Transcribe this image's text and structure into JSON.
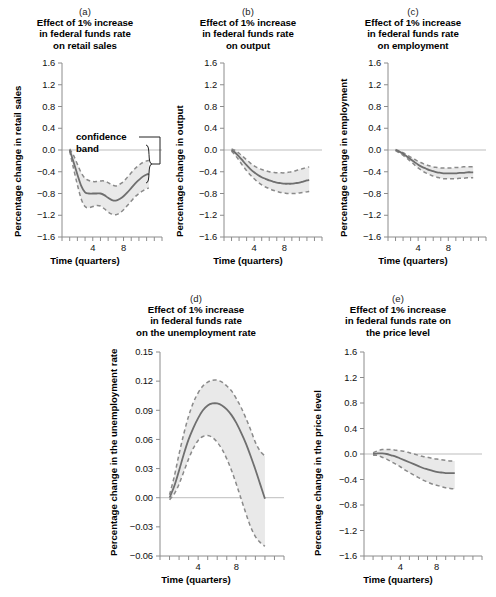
{
  "figure": {
    "background": "#ffffff",
    "band_fill": "#e9e9e9",
    "band_edge": "#8a8a8a",
    "center_line": "#6f6f6f",
    "axis_color": "#8c8c8c",
    "zero_line": "#bdbdbd"
  },
  "annotations": {
    "confidence_band_line1": "confidence",
    "confidence_band_line2": "band"
  },
  "chart_data": [
    {
      "id": "a",
      "type": "line",
      "letter": "(a)",
      "title_lines": [
        "Effect of 1% increase",
        "in federal funds rate",
        "on retail sales"
      ],
      "title": "Effect of 1% increase in federal funds rate on retail sales",
      "xlabel": "Time (quarters)",
      "ylabel": "Percentage change in retail sales",
      "ylim": [
        -1.6,
        1.6
      ],
      "yticks": [
        "1.6",
        "1.2",
        "0.8",
        "0.4",
        "0.0",
        "−0.4",
        "−0.8",
        "−1.2",
        "−1.6"
      ],
      "ytick_values": [
        1.6,
        1.2,
        0.8,
        0.4,
        0.0,
        -0.4,
        -0.8,
        -1.2,
        -1.6
      ],
      "xlim": [
        0,
        13
      ],
      "xticks": [
        0,
        1,
        2,
        3,
        4,
        5,
        6,
        7,
        8,
        9,
        10,
        11,
        12,
        13
      ],
      "xtick_labels": [
        {
          "value": 4,
          "label": "4"
        },
        {
          "value": 8,
          "label": "8"
        }
      ],
      "grid": false,
      "legend": "none",
      "x": [
        1.0,
        1.5,
        2.0,
        2.5,
        3.0,
        3.5,
        4.0,
        4.5,
        5.0,
        5.5,
        6.0,
        6.5,
        7.0,
        7.5,
        8.0,
        8.5,
        9.0,
        9.5,
        10.0,
        10.5,
        11.0,
        11.3
      ],
      "series": [
        {
          "name": "point estimate",
          "values": [
            0.0,
            -0.22,
            -0.45,
            -0.66,
            -0.78,
            -0.8,
            -0.8,
            -0.8,
            -0.8,
            -0.83,
            -0.88,
            -0.92,
            -0.93,
            -0.9,
            -0.85,
            -0.78,
            -0.7,
            -0.62,
            -0.55,
            -0.49,
            -0.45,
            -0.44
          ]
        },
        {
          "name": "upper band",
          "values": [
            0.02,
            -0.1,
            -0.26,
            -0.42,
            -0.52,
            -0.56,
            -0.58,
            -0.58,
            -0.57,
            -0.57,
            -0.6,
            -0.64,
            -0.66,
            -0.63,
            -0.58,
            -0.5,
            -0.42,
            -0.34,
            -0.28,
            -0.23,
            -0.2,
            -0.19
          ]
        },
        {
          "name": "lower band",
          "values": [
            -0.02,
            -0.34,
            -0.64,
            -0.9,
            -1.04,
            -1.06,
            -1.04,
            -1.02,
            -1.03,
            -1.08,
            -1.14,
            -1.18,
            -1.19,
            -1.16,
            -1.1,
            -1.02,
            -0.94,
            -0.86,
            -0.8,
            -0.75,
            -0.71,
            -0.7
          ]
        }
      ]
    },
    {
      "id": "b",
      "type": "line",
      "letter": "(b)",
      "title_lines": [
        "Effect of 1% increase",
        "in federal funds rate",
        "on output"
      ],
      "title": "Effect of 1% increase in federal funds rate on output",
      "xlabel": "Time (quarters)",
      "ylabel": "Percentage change in output",
      "ylim": [
        -1.6,
        1.6
      ],
      "yticks": [
        "1.6",
        "1.2",
        "0.8",
        "0.4",
        "0.0",
        "−0.4",
        "−0.8",
        "−1.2",
        "−1.6"
      ],
      "ytick_values": [
        1.6,
        1.2,
        0.8,
        0.4,
        0.0,
        -0.4,
        -0.8,
        -1.2,
        -1.6
      ],
      "xlim": [
        0,
        13
      ],
      "xticks": [
        0,
        1,
        2,
        3,
        4,
        5,
        6,
        7,
        8,
        9,
        10,
        11,
        12,
        13
      ],
      "xtick_labels": [
        {
          "value": 4,
          "label": "4"
        },
        {
          "value": 8,
          "label": "8"
        }
      ],
      "grid": false,
      "legend": "none",
      "x": [
        1.0,
        1.5,
        2.0,
        2.5,
        3.0,
        3.5,
        4.0,
        4.5,
        5.0,
        5.5,
        6.0,
        6.5,
        7.0,
        7.5,
        8.0,
        8.5,
        9.0,
        9.5,
        10.0,
        10.5,
        11.0,
        11.3
      ],
      "series": [
        {
          "name": "point estimate",
          "values": [
            0.0,
            -0.05,
            -0.12,
            -0.2,
            -0.28,
            -0.35,
            -0.41,
            -0.46,
            -0.5,
            -0.53,
            -0.56,
            -0.58,
            -0.6,
            -0.61,
            -0.62,
            -0.62,
            -0.62,
            -0.61,
            -0.6,
            -0.58,
            -0.56,
            -0.55
          ]
        },
        {
          "name": "upper band",
          "values": [
            0.02,
            -0.01,
            -0.06,
            -0.12,
            -0.18,
            -0.24,
            -0.29,
            -0.33,
            -0.36,
            -0.38,
            -0.4,
            -0.41,
            -0.42,
            -0.42,
            -0.42,
            -0.41,
            -0.4,
            -0.38,
            -0.36,
            -0.34,
            -0.32,
            -0.31
          ]
        },
        {
          "name": "lower band",
          "values": [
            -0.02,
            -0.1,
            -0.19,
            -0.29,
            -0.38,
            -0.46,
            -0.53,
            -0.59,
            -0.64,
            -0.68,
            -0.71,
            -0.74,
            -0.76,
            -0.78,
            -0.79,
            -0.8,
            -0.8,
            -0.8,
            -0.79,
            -0.78,
            -0.77,
            -0.76
          ]
        }
      ]
    },
    {
      "id": "c",
      "type": "line",
      "letter": "(c)",
      "title_lines": [
        "Effect of 1% increase",
        "in federal funds rate",
        "on employment"
      ],
      "title": "Effect of 1% increase in federal funds rate on employment",
      "xlabel": "Time (quarters)",
      "ylabel": "Percentage change in employment",
      "ylim": [
        -1.6,
        1.6
      ],
      "yticks": [
        "1.6",
        "1.2",
        "0.8",
        "0.4",
        "0.0",
        "−0.4",
        "−0.8",
        "−1.2",
        "−1.6"
      ],
      "ytick_values": [
        1.6,
        1.2,
        0.8,
        0.4,
        0.0,
        -0.4,
        -0.8,
        -1.2,
        -1.6
      ],
      "xlim": [
        0,
        13
      ],
      "xticks": [
        0,
        1,
        2,
        3,
        4,
        5,
        6,
        7,
        8,
        9,
        10,
        11,
        12,
        13
      ],
      "xtick_labels": [
        {
          "value": 4,
          "label": "4"
        },
        {
          "value": 8,
          "label": "8"
        }
      ],
      "grid": false,
      "legend": "none",
      "x": [
        1.0,
        1.5,
        2.0,
        2.5,
        3.0,
        3.5,
        4.0,
        4.5,
        5.0,
        5.5,
        6.0,
        6.5,
        7.0,
        7.5,
        8.0,
        8.5,
        9.0,
        9.5,
        10.0,
        10.5,
        11.0,
        11.3
      ],
      "series": [
        {
          "name": "point estimate",
          "values": [
            0.0,
            -0.03,
            -0.07,
            -0.12,
            -0.17,
            -0.22,
            -0.27,
            -0.31,
            -0.34,
            -0.37,
            -0.39,
            -0.41,
            -0.42,
            -0.43,
            -0.43,
            -0.43,
            -0.43,
            -0.42,
            -0.42,
            -0.41,
            -0.41,
            -0.41
          ]
        },
        {
          "name": "upper band",
          "values": [
            0.01,
            -0.02,
            -0.05,
            -0.09,
            -0.13,
            -0.17,
            -0.21,
            -0.24,
            -0.27,
            -0.29,
            -0.31,
            -0.32,
            -0.33,
            -0.33,
            -0.33,
            -0.33,
            -0.32,
            -0.32,
            -0.31,
            -0.31,
            -0.31,
            -0.31
          ]
        },
        {
          "name": "lower band",
          "values": [
            -0.01,
            -0.05,
            -0.1,
            -0.15,
            -0.21,
            -0.27,
            -0.33,
            -0.38,
            -0.42,
            -0.45,
            -0.48,
            -0.5,
            -0.52,
            -0.53,
            -0.53,
            -0.53,
            -0.53,
            -0.52,
            -0.52,
            -0.51,
            -0.51,
            -0.51
          ]
        }
      ]
    },
    {
      "id": "d",
      "type": "line",
      "letter": "(d)",
      "title_lines": [
        "Effect of 1% increase",
        "in federal funds rate",
        "on the unemployment rate"
      ],
      "title": "Effect of 1% increase in federal funds rate on the unemployment rate",
      "xlabel": "Time (quarters)",
      "ylabel": "Percentage change in the unemployment rate",
      "ylim": [
        -0.06,
        0.15
      ],
      "yticks": [
        "0.15",
        "0.12",
        "0.09",
        "0.06",
        "0.03",
        "0.00",
        "−0.03",
        "−0.06"
      ],
      "ytick_values": [
        0.15,
        0.12,
        0.09,
        0.06,
        0.03,
        0.0,
        -0.03,
        -0.06
      ],
      "xlim": [
        0,
        13
      ],
      "xticks": [
        0,
        1,
        2,
        3,
        4,
        5,
        6,
        7,
        8,
        9,
        10,
        11,
        12,
        13
      ],
      "xtick_labels": [
        {
          "value": 4,
          "label": "4"
        },
        {
          "value": 8,
          "label": "8"
        }
      ],
      "grid": false,
      "legend": "none",
      "x": [
        1.0,
        1.5,
        2.0,
        2.5,
        3.0,
        3.5,
        4.0,
        4.5,
        5.0,
        5.5,
        6.0,
        6.5,
        7.0,
        7.5,
        8.0,
        8.5,
        9.0,
        9.5,
        10.0,
        10.5,
        11.0
      ],
      "series": [
        {
          "name": "point estimate",
          "values": [
            0.0,
            0.012,
            0.028,
            0.045,
            0.06,
            0.072,
            0.082,
            0.09,
            0.095,
            0.097,
            0.097,
            0.095,
            0.091,
            0.085,
            0.077,
            0.067,
            0.056,
            0.043,
            0.029,
            0.014,
            -0.001
          ]
        },
        {
          "name": "upper band",
          "values": [
            0.003,
            0.022,
            0.045,
            0.066,
            0.084,
            0.098,
            0.108,
            0.115,
            0.119,
            0.121,
            0.121,
            0.119,
            0.115,
            0.11,
            0.102,
            0.093,
            0.082,
            0.07,
            0.057,
            0.048,
            0.043
          ]
        },
        {
          "name": "lower band",
          "values": [
            -0.002,
            0.004,
            0.014,
            0.027,
            0.04,
            0.051,
            0.059,
            0.063,
            0.064,
            0.062,
            0.057,
            0.05,
            0.04,
            0.028,
            0.014,
            -0.001,
            -0.016,
            -0.03,
            -0.04,
            -0.046,
            -0.05
          ]
        }
      ]
    },
    {
      "id": "e",
      "type": "line",
      "letter": "(e)",
      "title_lines": [
        "Effect of 1% increase",
        "in federal funds rate on",
        "the price level"
      ],
      "title": "Effect of 1% increase in federal funds rate on the price level",
      "xlabel": "Time (quarters)",
      "ylabel": "Percentage change in the price level",
      "ylim": [
        -1.6,
        1.6
      ],
      "yticks": [
        "1.6",
        "1.2",
        "0.8",
        "0.4",
        "0.0",
        "−0.4",
        "−0.8",
        "−1.2",
        "−1.6"
      ],
      "ytick_values": [
        1.6,
        1.2,
        0.8,
        0.4,
        0.0,
        -0.4,
        -0.8,
        -1.2,
        -1.6
      ],
      "xlim": [
        0,
        13
      ],
      "xticks": [
        0,
        1,
        2,
        3,
        4,
        5,
        6,
        7,
        8,
        9,
        10,
        11,
        12,
        13
      ],
      "xtick_labels": [
        {
          "value": 4,
          "label": "4"
        },
        {
          "value": 8,
          "label": "8"
        }
      ],
      "grid": false,
      "legend": "none",
      "x": [
        1.0,
        1.5,
        2.0,
        2.5,
        3.0,
        3.5,
        4.0,
        4.5,
        5.0,
        5.5,
        6.0,
        6.5,
        7.0,
        7.5,
        8.0,
        8.5,
        9.0,
        9.5,
        10.0
      ],
      "series": [
        {
          "name": "point estimate",
          "values": [
            0.0,
            0.01,
            0.01,
            0.0,
            -0.02,
            -0.04,
            -0.07,
            -0.1,
            -0.13,
            -0.16,
            -0.19,
            -0.22,
            -0.24,
            -0.26,
            -0.28,
            -0.29,
            -0.3,
            -0.3,
            -0.3
          ]
        },
        {
          "name": "upper band",
          "values": [
            0.02,
            0.05,
            0.07,
            0.07,
            0.07,
            0.06,
            0.05,
            0.04,
            0.02,
            0.0,
            -0.02,
            -0.04,
            -0.05,
            -0.07,
            -0.08,
            -0.09,
            -0.1,
            -0.11,
            -0.11
          ]
        },
        {
          "name": "lower band",
          "values": [
            -0.02,
            -0.02,
            -0.05,
            -0.08,
            -0.12,
            -0.16,
            -0.2,
            -0.25,
            -0.29,
            -0.33,
            -0.37,
            -0.41,
            -0.44,
            -0.47,
            -0.49,
            -0.51,
            -0.53,
            -0.54,
            -0.55
          ]
        }
      ]
    }
  ]
}
